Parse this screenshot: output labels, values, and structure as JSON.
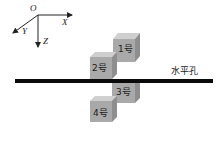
{
  "axes": {
    "origin": "O",
    "x": "X",
    "y": "Y",
    "z": "Z"
  },
  "hole": {
    "label": "水平孔",
    "color": "#0a0a0a"
  },
  "cubes": [
    {
      "id": 1,
      "label": "1号",
      "position": "above-right"
    },
    {
      "id": 2,
      "label": "2号",
      "position": "above-left"
    },
    {
      "id": 3,
      "label": "3号",
      "position": "below-right"
    },
    {
      "id": 4,
      "label": "4号",
      "position": "below-left"
    }
  ],
  "colors": {
    "cube_front": "#a9a9a9",
    "cube_top": "#cfcfcf",
    "cube_side": "#8e8e8e"
  }
}
